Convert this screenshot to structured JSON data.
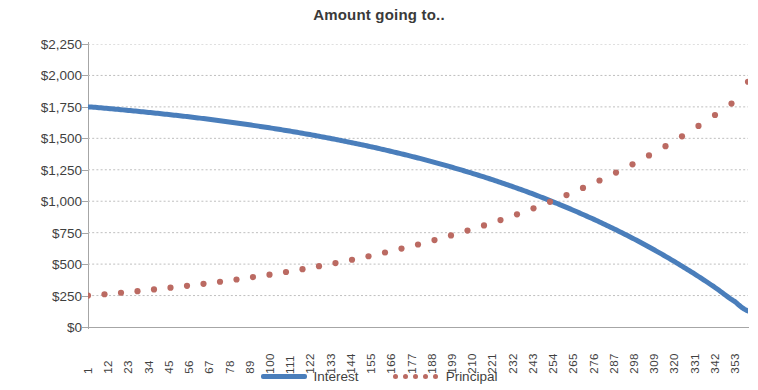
{
  "chart": {
    "title": "Amount going to..",
    "axis_color": "#a6a6a6",
    "grid_color": "#bfbfbf",
    "text_color": "#3f3f3f"
  },
  "legend": {
    "items": [
      {
        "label": "Interest",
        "color": "#4a7ebb",
        "style": "line"
      },
      {
        "label": "Principal",
        "color": "#bb6a62",
        "style": "dotted"
      }
    ]
  },
  "chart_data": {
    "type": "line",
    "title": "Amount going to..",
    "xlabel": "",
    "ylabel": "",
    "grid": true,
    "legend_position": "bottom",
    "xlim": [
      1,
      360
    ],
    "ylim": [
      0,
      2250
    ],
    "ytick_labels": [
      "$2,250",
      "$2,000",
      "$1,750",
      "$1,500",
      "$1,250",
      "$1,000",
      "$750",
      "$500",
      "$250",
      "$0"
    ],
    "ytick_values": [
      2250,
      2000,
      1750,
      1500,
      1250,
      1000,
      750,
      500,
      250,
      0
    ],
    "xtick_labels": [
      "1",
      "12",
      "23",
      "34",
      "45",
      "56",
      "67",
      "78",
      "89",
      "100",
      "111",
      "122",
      "133",
      "144",
      "155",
      "166",
      "177",
      "188",
      "199",
      "210",
      "221",
      "232",
      "243",
      "254",
      "265",
      "276",
      "287",
      "298",
      "309",
      "320",
      "331",
      "342",
      "353"
    ],
    "xtick_values": [
      1,
      12,
      23,
      34,
      45,
      56,
      67,
      78,
      89,
      100,
      111,
      122,
      133,
      144,
      155,
      166,
      177,
      188,
      199,
      210,
      221,
      232,
      243,
      254,
      265,
      276,
      287,
      298,
      309,
      320,
      331,
      342,
      353
    ],
    "series": [
      {
        "name": "Interest",
        "color": "#4a7ebb",
        "style": "solid",
        "width": 5,
        "x": [
          1,
          12,
          23,
          34,
          45,
          56,
          67,
          78,
          89,
          100,
          111,
          122,
          133,
          144,
          155,
          166,
          177,
          188,
          199,
          210,
          221,
          232,
          243,
          254,
          265,
          276,
          287,
          298,
          309,
          320,
          331,
          342,
          353,
          360
        ],
        "values": [
          1750,
          1737,
          1722,
          1706,
          1689,
          1671,
          1651,
          1630,
          1607,
          1583,
          1557,
          1529,
          1499,
          1467,
          1433,
          1396,
          1357,
          1315,
          1270,
          1222,
          1171,
          1116,
          1058,
          995,
          928,
          857,
          781,
          700,
          613,
          520,
          421,
          315,
          201,
          128
        ]
      },
      {
        "name": "Principal",
        "color": "#bb6a62",
        "style": "dotted",
        "width": 5,
        "x": [
          1,
          12,
          23,
          34,
          45,
          56,
          67,
          78,
          89,
          100,
          111,
          122,
          133,
          144,
          155,
          166,
          177,
          188,
          199,
          210,
          221,
          232,
          243,
          254,
          265,
          276,
          287,
          298,
          309,
          320,
          331,
          342,
          353,
          360
        ],
        "values": [
          250,
          263,
          278,
          294,
          311,
          329,
          349,
          370,
          393,
          417,
          443,
          471,
          501,
          533,
          567,
          604,
          643,
          685,
          730,
          778,
          829,
          884,
          942,
          1005,
          1072,
          1143,
          1219,
          1300,
          1387,
          1480,
          1579,
          1685,
          1799,
          1950
        ]
      }
    ]
  }
}
